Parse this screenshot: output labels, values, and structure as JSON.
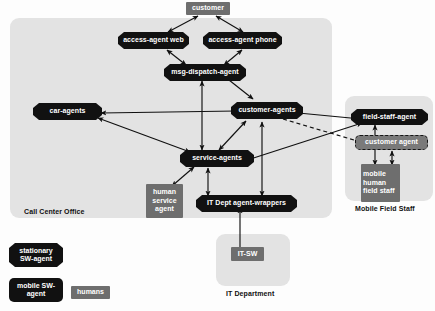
{
  "diagram": {
    "colors": {
      "panel_fill": "#e3e3e3",
      "sw_agent_fill": "#111111",
      "human_fill": "#6e6e6e",
      "dashed_agent_fill": "#7a7a7a",
      "connector": "#101010",
      "page_background": "#fdfdfd"
    }
  },
  "panels": [
    {
      "id": "call-center-office",
      "label": "Call Center Office"
    },
    {
      "id": "mobile-field-staff",
      "label": "Mobile Field Staff"
    },
    {
      "id": "it-department",
      "label": "IT Department"
    }
  ],
  "nodes": [
    {
      "id": "customer",
      "label": "customer",
      "type": "humans"
    },
    {
      "id": "access-agent-web",
      "label": "access-agent web",
      "type": "stationary-sw-agent"
    },
    {
      "id": "access-agent-phone",
      "label": "access-agent phone",
      "type": "stationary-sw-agent"
    },
    {
      "id": "msg-dispatch-agent",
      "label": "msg-dispatch-agent",
      "type": "stationary-sw-agent"
    },
    {
      "id": "car-agents",
      "label": "car-agents",
      "type": "stationary-sw-agent"
    },
    {
      "id": "customer-agents",
      "label": "customer-agents",
      "type": "stationary-sw-agent"
    },
    {
      "id": "service-agents",
      "label": "service-agents",
      "type": "stationary-sw-agent"
    },
    {
      "id": "human-service-agent",
      "label": "human service agent",
      "type": "humans"
    },
    {
      "id": "it-dept-agent-wrappers",
      "label": "IT Dept agent-wrappers",
      "type": "stationary-sw-agent"
    },
    {
      "id": "field-staff-agent",
      "label": "field-staff-agent",
      "type": "stationary-sw-agent"
    },
    {
      "id": "customer-agent-mobile",
      "label": "customer agent",
      "type": "mobile-sw-agent-dashed"
    },
    {
      "id": "mobile-human-field-staff",
      "label": "mobile human field staff",
      "type": "humans"
    },
    {
      "id": "it-sw",
      "label": "IT-SW",
      "type": "humans"
    }
  ],
  "legend": {
    "items": [
      {
        "id": "legend-stationary",
        "label": "stationary SW-agent",
        "type": "stationary-sw-agent"
      },
      {
        "id": "legend-mobile",
        "label": "mobile SW-agent",
        "type": "mobile-sw-agent"
      },
      {
        "id": "legend-humans",
        "label": "humans",
        "type": "humans"
      }
    ]
  },
  "edges": [
    {
      "from": "customer",
      "to": "access-agent-web",
      "style": "solid",
      "arrows": "both"
    },
    {
      "from": "customer",
      "to": "access-agent-phone",
      "style": "solid",
      "arrows": "both"
    },
    {
      "from": "access-agent-web",
      "to": "msg-dispatch-agent",
      "style": "solid",
      "arrows": "both"
    },
    {
      "from": "access-agent-phone",
      "to": "msg-dispatch-agent",
      "style": "solid",
      "arrows": "both"
    },
    {
      "from": "msg-dispatch-agent",
      "to": "customer-agents",
      "style": "solid",
      "arrows": "end"
    },
    {
      "from": "msg-dispatch-agent",
      "to": "service-agents",
      "style": "solid",
      "arrows": "both"
    },
    {
      "from": "customer-agents",
      "to": "car-agents",
      "style": "solid",
      "arrows": "end"
    },
    {
      "from": "customer-agents",
      "to": "service-agents",
      "style": "solid",
      "arrows": "both"
    },
    {
      "from": "customer-agents",
      "to": "field-staff-agent",
      "style": "solid",
      "arrows": "end"
    },
    {
      "from": "customer-agents",
      "to": "customer-agent-mobile",
      "style": "dashed",
      "arrows": "end"
    },
    {
      "from": "service-agents",
      "to": "car-agents",
      "style": "solid",
      "arrows": "both"
    },
    {
      "from": "service-agents",
      "to": "field-staff-agent",
      "style": "solid",
      "arrows": "both"
    },
    {
      "from": "service-agents",
      "to": "human-service-agent",
      "style": "solid",
      "arrows": "both"
    },
    {
      "from": "service-agents",
      "to": "it-dept-agent-wrappers",
      "style": "solid",
      "arrows": "both"
    },
    {
      "from": "customer-agents",
      "to": "it-dept-agent-wrappers",
      "style": "solid",
      "arrows": "both"
    },
    {
      "from": "field-staff-agent",
      "to": "mobile-human-field-staff",
      "style": "solid",
      "arrows": "both"
    },
    {
      "from": "customer-agent-mobile",
      "to": "mobile-human-field-staff",
      "style": "solid",
      "arrows": "both"
    },
    {
      "from": "it-sw",
      "to": "it-dept-agent-wrappers",
      "style": "solid",
      "arrows": "end"
    }
  ]
}
